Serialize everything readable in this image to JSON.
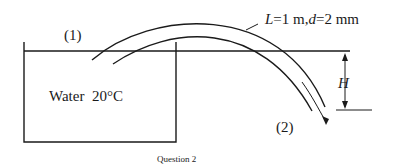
{
  "diagram": {
    "point1_label": "(1)",
    "point2_label": "(2)",
    "tube_label": "L=1 m,d=2 mm",
    "tube_label_parts": {
      "L": "L",
      "L_val": "=1 m,",
      "d": "d",
      "d_val": "=2 mm"
    },
    "tank_label": "Water  20°C",
    "height_label": "H",
    "caption": "Question 2"
  }
}
